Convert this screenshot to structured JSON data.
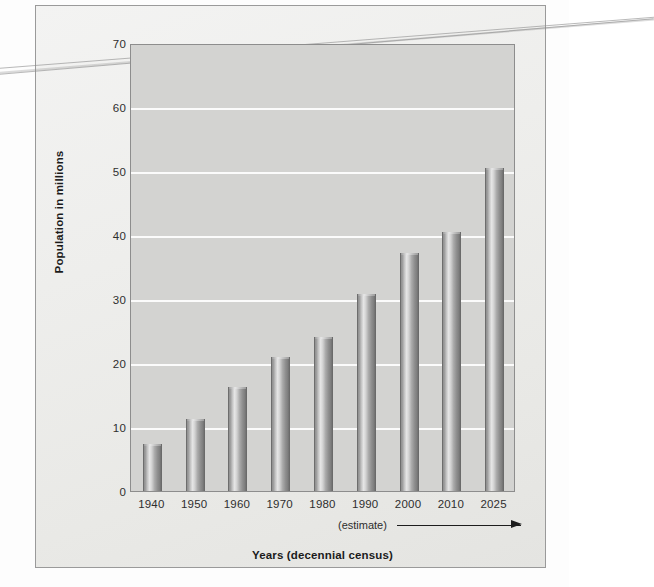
{
  "chart_data": {
    "type": "bar",
    "title": "",
    "xlabel": "Years (decennial census)",
    "ylabel": "Population in millions",
    "categories": [
      "1940",
      "1950",
      "1960",
      "1970",
      "1980",
      "1990",
      "2000",
      "2010",
      "2025"
    ],
    "values": [
      7.3,
      11.2,
      16.2,
      21.0,
      24.0,
      30.8,
      37.2,
      40.5,
      50.5
    ],
    "ylim": [
      0,
      70
    ],
    "yticks": [
      0,
      10,
      20,
      30,
      40,
      50,
      60,
      70
    ],
    "ytick_labels": [
      "0",
      "10",
      "20",
      "30",
      "40",
      "50",
      "60",
      "70"
    ],
    "grid": "horizontal",
    "legend": "none",
    "annotations": [
      {
        "text": "(estimate)",
        "note": "below x-axis, pointing right with arrow toward later years"
      }
    ],
    "bar_style": "cylinder-gradient-gray",
    "plot_background": "#d3d3d1",
    "gridline_color": "#fbfbfb"
  },
  "axes": {
    "y_title": "Population in millions",
    "x_title": "Years (decennial census)"
  },
  "estimate": {
    "label": "(estimate)"
  },
  "colors": {
    "paper": "#f0f0ee",
    "plot_bg": "#d3d3d1",
    "bar_dark": "#6f6f6f",
    "bar_light": "#e6e6e6",
    "grid": "#fbfbfb",
    "text": "#1b1b1b"
  }
}
